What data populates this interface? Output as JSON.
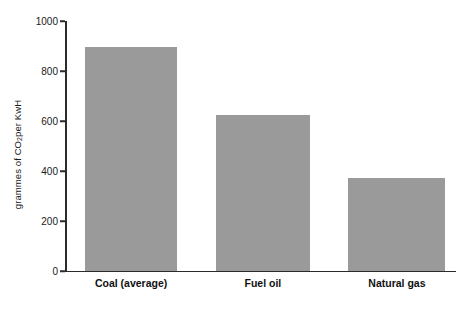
{
  "chart_data": {
    "type": "bar",
    "title": "",
    "subtitle": "",
    "xlabel": "",
    "ylabel": "grammes of CO2 per KwH",
    "ylabel_parts": {
      "before": "grammes of CO",
      "subscript": "2",
      "after": " per KwH"
    },
    "categories": [
      "Coal (average)",
      "Fuel oil",
      "Natural gas"
    ],
    "values": [
      895,
      625,
      372
    ],
    "ylim": [
      0,
      1000
    ],
    "yticks": [
      0,
      200,
      400,
      600,
      800,
      1000
    ],
    "ytick_labels": [
      "0",
      "200",
      "400",
      "600",
      "800",
      "1000"
    ],
    "grid": false,
    "legend": false,
    "legend_position": "none",
    "bar_color": "#9a9a9a",
    "axis_color": "#2b2b2b",
    "background_color": "#ffffff",
    "bar_geometry": [
      {
        "left_pct": 5.1,
        "width_pct": 23.5
      },
      {
        "left_pct": 38.6,
        "width_pct": 24.0
      },
      {
        "left_pct": 72.4,
        "width_pct": 24.8
      }
    ],
    "category_label_centers_pct": [
      16.9,
      50.6,
      84.9
    ]
  }
}
